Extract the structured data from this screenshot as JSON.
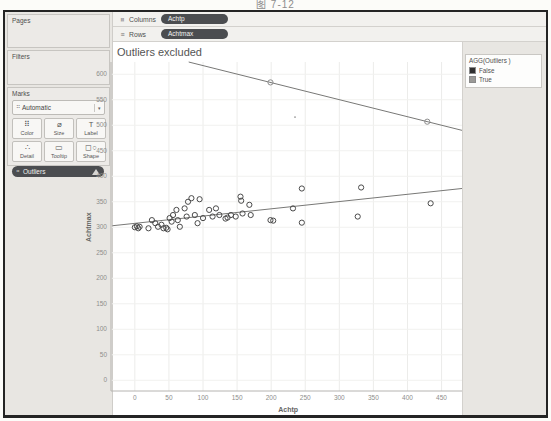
{
  "caption": "图 7-12",
  "shelves": {
    "columns": {
      "label": "Columns",
      "pill": "Achtp"
    },
    "rows": {
      "label": "Rows",
      "pill": "Achtmax"
    }
  },
  "sidebar": {
    "pages_label": "Pages",
    "filters_label": "Filters",
    "marks_label": "Marks",
    "mark_type": {
      "value": "Automatic",
      "icon_glyph": "⠛",
      "caret": "▾"
    },
    "mark_buttons": [
      {
        "name": "color",
        "label": "Color",
        "glyph": "⠿"
      },
      {
        "name": "size",
        "label": "Size",
        "glyph": "⌀"
      },
      {
        "name": "label",
        "label": "Label",
        "glyph": "T"
      },
      {
        "name": "detail",
        "label": "Detail",
        "glyph": "∴"
      },
      {
        "name": "tooltip",
        "label": "Tooltip",
        "glyph": "▭"
      },
      {
        "name": "shape",
        "label": "Shape",
        "glyph": "◻○"
      }
    ],
    "marks_pill": {
      "text": "Outliers",
      "icon_glyph": "⠛",
      "has_warning": true
    }
  },
  "legend": {
    "title": "AGG(Outliers )",
    "items": [
      {
        "label": "False",
        "color": "#2f2f2f"
      },
      {
        "label": "True",
        "color": "#9a9996"
      }
    ]
  },
  "chart_data": {
    "type": "scatter",
    "title": "Outliers excluded",
    "xlabel": "Achtp",
    "ylabel": "Achtmax",
    "xlim": [
      -35,
      480
    ],
    "ylim": [
      -21,
      624
    ],
    "x_ticks": [
      0,
      50,
      100,
      150,
      200,
      250,
      300,
      350,
      400,
      450
    ],
    "y_ticks": [
      0,
      50,
      100,
      150,
      200,
      250,
      300,
      350,
      400,
      450,
      500,
      550,
      600
    ],
    "grid": true,
    "legend_position": "right",
    "series": [
      {
        "name": "False",
        "stroke": "#4a4a4a",
        "points": [
          [
            0,
            300
          ],
          [
            3,
            302
          ],
          [
            5,
            298
          ],
          [
            7,
            301
          ],
          [
            20,
            298
          ],
          [
            25,
            314
          ],
          [
            30,
            308
          ],
          [
            34,
            301
          ],
          [
            39,
            305
          ],
          [
            42,
            298
          ],
          [
            46,
            299
          ],
          [
            48,
            296
          ],
          [
            51,
            318
          ],
          [
            54,
            311
          ],
          [
            56,
            324
          ],
          [
            61,
            334
          ],
          [
            63,
            314
          ],
          [
            66,
            301
          ],
          [
            73,
            337
          ],
          [
            76,
            321
          ],
          [
            78,
            350
          ],
          [
            83,
            357
          ],
          [
            88,
            324
          ],
          [
            92,
            308
          ],
          [
            95,
            355
          ],
          [
            100,
            318
          ],
          [
            109,
            334
          ],
          [
            114,
            321
          ],
          [
            119,
            337
          ],
          [
            124,
            324
          ],
          [
            133,
            317
          ],
          [
            136,
            319
          ],
          [
            141,
            324
          ],
          [
            148,
            321
          ],
          [
            155,
            360
          ],
          [
            156,
            352
          ],
          [
            158,
            327
          ],
          [
            168,
            344
          ],
          [
            170,
            324
          ],
          [
            199,
            314
          ],
          [
            203,
            313
          ],
          [
            232,
            337
          ],
          [
            245,
            376
          ],
          [
            245,
            309
          ],
          [
            327,
            321
          ],
          [
            332,
            378
          ],
          [
            434,
            347
          ]
        ]
      },
      {
        "name": "True",
        "stroke": "#8d8d8d",
        "points": [
          [
            199,
            584
          ],
          [
            429,
            507
          ]
        ]
      }
    ],
    "trend_lines": [
      {
        "series": "False",
        "x1": -33,
        "y1": 303,
        "x2": 480,
        "y2": 376
      },
      {
        "series": "True",
        "x1": 79,
        "y1": 624,
        "x2": 480,
        "y2": 490
      }
    ],
    "speck_point": [
      235,
      516
    ],
    "colors": {
      "trend": "#787876",
      "grid_v": "#ececea",
      "grid_h": "#f1f1ef",
      "axis": "#b6b4b1",
      "tick_text": "#8e8e8c",
      "axis_title": "#666664"
    }
  }
}
